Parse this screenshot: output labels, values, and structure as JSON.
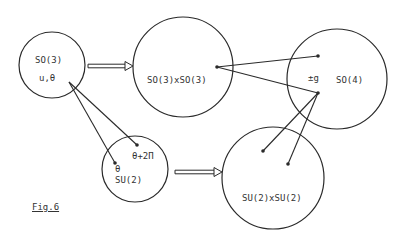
{
  "diagram": {
    "colors": {
      "stroke": "#2a2a2a",
      "text": "#333333",
      "background": "#ffffff"
    },
    "nodes": [
      {
        "id": "so3",
        "label": "SO(3)",
        "sublabel": "u,θ",
        "cx": 52,
        "cy": 65,
        "r": 33
      },
      {
        "id": "so3xso3",
        "label": "SO(3)xSO(3)",
        "cx": 183,
        "cy": 67,
        "r": 50
      },
      {
        "id": "so4",
        "label": "SO(4)",
        "sublabel": "±g",
        "cx": 337,
        "cy": 79,
        "r": 50
      },
      {
        "id": "su2",
        "label": "SU(2)",
        "sublabel": "θ",
        "extra_label": "θ+2Π",
        "cx": 135,
        "cy": 169,
        "r": 33
      },
      {
        "id": "su2xsu2",
        "label": "SU(2)xSU(2)",
        "cx": 273,
        "cy": 178,
        "r": 51
      }
    ],
    "arrows": [
      {
        "from": "so3",
        "to": "so3xso3",
        "x1": 88,
        "y1": 66,
        "x2": 133,
        "y2": 66
      },
      {
        "from": "su2",
        "to": "su2xsu2",
        "x1": 175,
        "y1": 172,
        "x2": 222,
        "y2": 172
      }
    ],
    "points": [
      {
        "id": "so3xso3-pt",
        "x": 217,
        "y": 67
      },
      {
        "id": "so4-pt-top",
        "x": 318,
        "y": 56
      },
      {
        "id": "so4-pt-bottom",
        "x": 318,
        "y": 93
      },
      {
        "id": "su2-pt-theta",
        "x": 115,
        "y": 163
      },
      {
        "id": "su2-pt-theta2pi",
        "x": 137,
        "y": 145
      },
      {
        "id": "su2xsu2-pt-a",
        "x": 263,
        "y": 151
      },
      {
        "id": "su2xsu2-pt-b",
        "x": 288,
        "y": 164
      }
    ],
    "lines": [
      {
        "x1": 69,
        "y1": 82,
        "x2": 115,
        "y2": 163
      },
      {
        "x1": 69,
        "y1": 82,
        "x2": 137,
        "y2": 145
      },
      {
        "x1": 217,
        "y1": 67,
        "x2": 318,
        "y2": 56
      },
      {
        "x1": 217,
        "y1": 67,
        "x2": 318,
        "y2": 93
      },
      {
        "x1": 318,
        "y1": 93,
        "x2": 263,
        "y2": 151
      },
      {
        "x1": 318,
        "y1": 93,
        "x2": 288,
        "y2": 164
      }
    ],
    "caption": "Fig.6"
  }
}
